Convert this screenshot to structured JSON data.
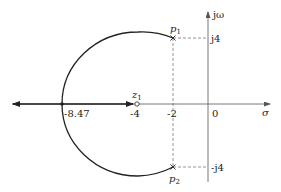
{
  "diagram": {
    "type": "root-locus",
    "axes": {
      "real_label": "σ",
      "imag_label": "jω",
      "origin_label": "0"
    },
    "ticks": {
      "real": [
        "-8.47",
        "-4",
        "-2"
      ],
      "imag": [
        "j4",
        "-j4"
      ]
    },
    "poles": [
      {
        "label": "p",
        "sub": "1",
        "re": -2,
        "im": 4
      },
      {
        "label": "p",
        "sub": "2",
        "re": -2,
        "im": -4
      }
    ],
    "zeros": [
      {
        "label": "z",
        "sub": "1",
        "re": -4,
        "im": 0
      }
    ],
    "breakaway_point": -8.47,
    "colors": {
      "locus": "#222222",
      "axis": "#555555",
      "guide": "#666666"
    }
  }
}
